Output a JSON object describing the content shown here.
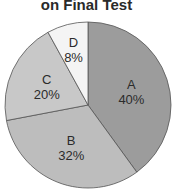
{
  "chart_data": {
    "type": "pie",
    "title": "on Final Test",
    "categories": [
      "A",
      "B",
      "C",
      "D"
    ],
    "values": [
      40,
      32,
      20,
      8
    ],
    "labels": [
      "40%",
      "32%",
      "20%",
      "8%"
    ],
    "colors": [
      "#9c9c9c",
      "#bdbdbd",
      "#c8c8c8",
      "#f4f4f4"
    ],
    "start_angle_deg": 0,
    "direction": "clockwise",
    "legend": "none"
  },
  "slices": [
    {
      "name": "A",
      "pct": "40%"
    },
    {
      "name": "B",
      "pct": "32%"
    },
    {
      "name": "C",
      "pct": "20%"
    },
    {
      "name": "D",
      "pct": "8%"
    }
  ]
}
